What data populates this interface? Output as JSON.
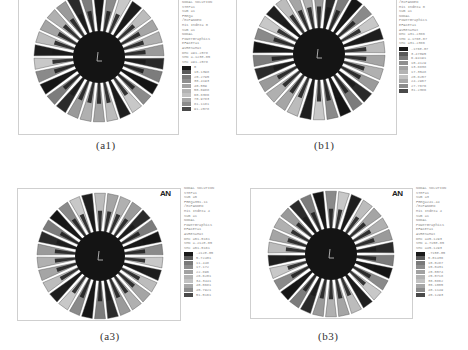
{
  "figure": {
    "panels": [
      {
        "id": "a1",
        "caption": "(a1)",
        "logo": "",
        "legend": {
          "header": [
            "NODAL SOLUTION",
            "STEP=1",
            "SUB =1",
            "FREQ=",
            "/EXPANDED",
            "Mis Index= 0",
            "SUB =1",
            "NODAL",
            "PowerGraphics",
            "EFACET=1",
            "AVRES=Mat",
            "DMX =91.2578",
            "SMN =.123E-05",
            "SMX =91.2578"
          ],
          "values": [
            "0",
            "10.1398",
            "20.2795",
            "30.4193",
            "40.559",
            "50.6988",
            "60.8386",
            "70.9783",
            "81.1181",
            "91.2578"
          ],
          "colors": [
            "#1a1a1a",
            "#5a5a5a",
            "#7a7a7a",
            "#8e8e8e",
            "#a2a2a2",
            "#b3b3b3",
            "#c2c2c2",
            "#a8a8a8",
            "#8c8c8c",
            "#4a4a4a"
          ]
        },
        "fan": {
          "blades": 30,
          "hub_color": "#141414"
        }
      },
      {
        "id": "b1",
        "caption": "(b1)",
        "logo": "",
        "legend": {
          "header": [
            "/EXPANDED",
            "Mis Index= 0",
            "SUB =1",
            "NODAL",
            "PowerGraphics",
            "EFACET=1",
            "AVRES=Mat",
            "DMX =31.2386",
            "SMN =.176E-07",
            "SMX =31.2386"
          ],
          "values": [
            ".176E-07",
            "3.47095",
            "6.94191",
            "10.4129",
            "13.8838",
            "17.3548",
            "20.8257",
            "24.2967",
            "27.7676",
            "31.2386"
          ],
          "colors": [
            "#1a1a1a",
            "#5a5a5a",
            "#7a7a7a",
            "#8e8e8e",
            "#a2a2a2",
            "#b3b3b3",
            "#c2c2c2",
            "#a8a8a8",
            "#8c8c8c",
            "#4a4a4a"
          ]
        },
        "fan": {
          "blades": 30,
          "hub_color": "#141414"
        }
      },
      {
        "id": "a3",
        "caption": "(a3)",
        "logo": "AN",
        "legend": {
          "header": [
            "NODAL SOLUTION",
            "STEP=1",
            "SUB =5",
            "FREQ=351.11",
            "/EXPANDED",
            "Mis Index= 4",
            "SUB =1",
            "NODAL",
            "PowerGraphics",
            "EFACET=1",
            "AVRES=Mat",
            "DMX =51.5161",
            "SMN =.212E-05",
            "SMX =51.5161"
          ],
          "values": [
            ".212E-05",
            "5.72401",
            "11.448",
            "17.172",
            "22.896",
            "28.6201",
            "34.3441",
            "40.0681",
            "45.7921",
            "51.5161"
          ],
          "colors": [
            "#1a1a1a",
            "#5a5a5a",
            "#7a7a7a",
            "#8e8e8e",
            "#a2a2a2",
            "#b3b3b3",
            "#c2c2c2",
            "#a8a8a8",
            "#8c8c8c",
            "#4a4a4a"
          ]
        },
        "fan": {
          "blades": 30,
          "hub_color": "#141414"
        }
      },
      {
        "id": "b3",
        "caption": "(b3)",
        "logo": "AN",
        "legend": {
          "header": [
            "NODAL SOLUTION",
            "STEP=1",
            "SUB =3",
            "FREQ=241.44",
            "/EXPANDED",
            "Mis Index= 4",
            "SUB =1",
            "NODAL",
            "PowerGraphics",
            "EFACET=1",
            "AVRES=Mat",
            "DMX =45.1293",
            "SMN =.715E-05",
            "SMX =45.1293"
          ],
          "values": [
            ".715E-05",
            "5.01436",
            "10.0287",
            "15.0431",
            "20.0574",
            "25.0718",
            "30.0862",
            "35.1005",
            "40.1149",
            "45.1293"
          ],
          "colors": [
            "#1a1a1a",
            "#5a5a5a",
            "#7a7a7a",
            "#8e8e8e",
            "#a2a2a2",
            "#b3b3b3",
            "#c2c2c2",
            "#a8a8a8",
            "#8c8c8c",
            "#4a4a4a"
          ]
        },
        "fan": {
          "blades": 30,
          "hub_color": "#141414"
        }
      }
    ]
  }
}
